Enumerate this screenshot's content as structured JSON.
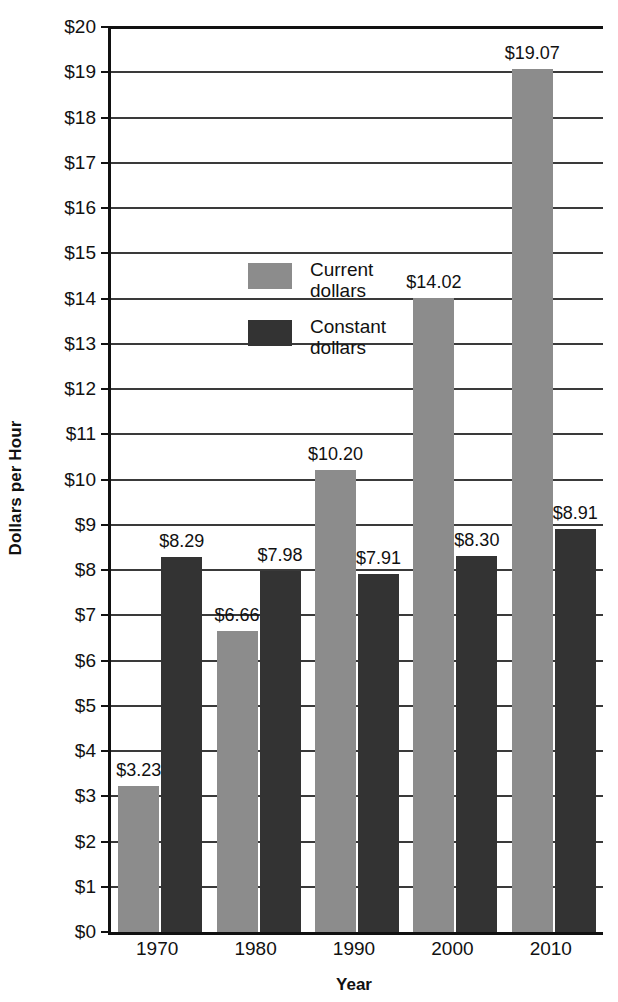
{
  "chart_data": {
    "type": "bar",
    "title": "",
    "xlabel": "Year",
    "ylabel": "Dollars per Hour",
    "categories": [
      "1970",
      "1980",
      "1990",
      "2000",
      "2010"
    ],
    "ylim": [
      0,
      20
    ],
    "ytick_values": [
      0,
      1,
      2,
      3,
      4,
      5,
      6,
      7,
      8,
      9,
      10,
      11,
      12,
      13,
      14,
      15,
      16,
      17,
      18,
      19,
      20
    ],
    "ytick_labels": [
      "$0",
      "$1",
      "$2",
      "$3",
      "$4",
      "$5",
      "$6",
      "$7",
      "$8",
      "$9",
      "$10",
      "$11",
      "$12",
      "$13",
      "$14",
      "$15",
      "$16",
      "$17",
      "$18",
      "$19",
      "$20"
    ],
    "grid": true,
    "legend_position": "inside-upper-left",
    "series": [
      {
        "name": "Current dollars",
        "legend_label_line1": "Current",
        "legend_label_line2": "dollars",
        "color": "#8c8c8c",
        "values": [
          3.23,
          6.66,
          10.2,
          14.02,
          19.07
        ],
        "data_labels": [
          "$3.23",
          "$6.66",
          "$10.20",
          "$14.02",
          "$19.07"
        ]
      },
      {
        "name": "Constant dollars",
        "legend_label_line1": "Constant",
        "legend_label_line2": "dollars",
        "color": "#333333",
        "values": [
          8.29,
          7.98,
          7.91,
          8.3,
          8.91
        ],
        "data_labels": [
          "$8.29",
          "$7.98",
          "$7.91",
          "$8.30",
          "$8.91"
        ]
      }
    ]
  },
  "axis": {
    "y_title": "Dollars per Hour",
    "x_title": "Year"
  },
  "colors": {
    "current_dollars": "#8c8c8c",
    "constant_dollars": "#333333",
    "axis": "#111111",
    "gridline": "#3a3a3a",
    "background": "#ffffff"
  }
}
